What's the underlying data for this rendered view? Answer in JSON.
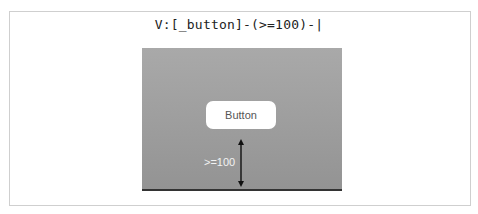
{
  "diagram": {
    "format_string": "V:[_button]-(>=100)-|",
    "button_label": "Button",
    "spacing_label": ">=100",
    "colors": {
      "panel": "#9e9e9e",
      "button_bg": "#ffffff",
      "baseline": "#333333",
      "arrow": "#111111"
    }
  }
}
